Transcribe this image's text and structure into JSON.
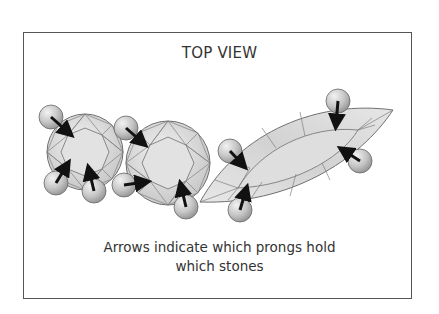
{
  "diagram": {
    "title": "TOP VIEW",
    "caption_line1": "Arrows indicate which prongs hold",
    "caption_line2": "which stones",
    "colors": {
      "border": "#555555",
      "stone_fill": "#dcdcdc",
      "facet_line": "#707070",
      "prong_fill": "#c8c8c8",
      "arrow": "#111111"
    },
    "stones": [
      {
        "id": "round-stone-small",
        "shape": "round",
        "prongs": 4
      },
      {
        "id": "round-stone-large",
        "shape": "round",
        "prongs": 3
      },
      {
        "id": "marquise-stone",
        "shape": "marquise",
        "prongs": 4
      }
    ]
  }
}
